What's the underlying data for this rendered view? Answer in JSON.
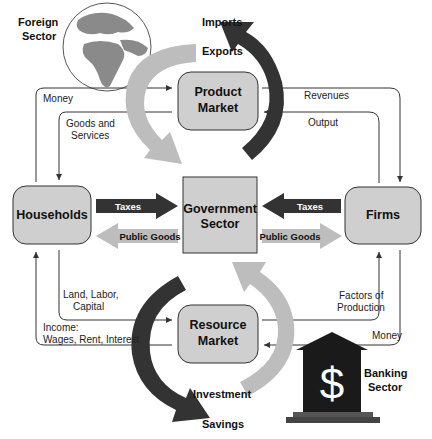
{
  "colors": {
    "box_fill": "#cfcfcf",
    "box_stroke": "#333333",
    "dark_arrow": "#333333",
    "light_arrow": "#bdbdbd",
    "line": "#333333",
    "bank": "#1a1a1a",
    "globe_land": "#8a8a8a",
    "globe_sea": "#ffffff"
  },
  "nodes": {
    "households": "Households",
    "firms": "Firms",
    "government": [
      "Government",
      "Sector"
    ],
    "product_market": [
      "Product",
      "Market"
    ],
    "resource_market": [
      "Resource",
      "Market"
    ],
    "foreign_sector": [
      "Foreign",
      "Sector"
    ],
    "banking_sector": [
      "Banking",
      "Sector"
    ]
  },
  "flows": {
    "imports": "Imports",
    "exports": "Exports",
    "investment": "Investment",
    "savings": "Savings",
    "money_top": "Money",
    "goods_services": [
      "Goods and",
      "Services"
    ],
    "revenues": "Revenues",
    "output": "Output",
    "taxes_left": "Taxes",
    "public_goods_left": "Public Goods",
    "taxes_right": "Taxes",
    "public_goods_right": "Public Goods",
    "land_labor_capital": [
      "Land, Labor,",
      "Capital"
    ],
    "income": [
      "Income:",
      "Wages, Rent, Interest"
    ],
    "factors_of_production": [
      "Factors of",
      "Production"
    ],
    "money_bottom": "Money"
  },
  "icons": {
    "globe": "globe-icon",
    "bank": "bank-icon",
    "dollar": "$"
  }
}
